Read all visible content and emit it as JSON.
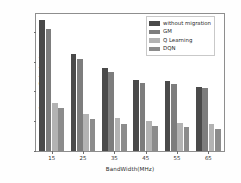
{
  "chart_data": {
    "type": "bar",
    "title": "",
    "xlabel": "BandWidth(MHz)",
    "ylabel": "Average Delay(ms)",
    "categories": [
      "15",
      "25",
      "35",
      "45",
      "55",
      "65"
    ],
    "xtick_labels": [
      "15",
      "25",
      "35",
      "45",
      "55",
      "65"
    ],
    "ytick_labels": [
      "0",
      "20",
      "40",
      "60",
      "80"
    ],
    "ytick_values": [
      0,
      20,
      40,
      60,
      80
    ],
    "ylim": [
      0,
      92
    ],
    "grid": false,
    "legend_position": "upper right",
    "series": [
      {
        "name": "without migration",
        "color": "#4a4a4a",
        "values": [
          88,
          65,
          55.5,
          48,
          47,
          43
        ]
      },
      {
        "name": "GM",
        "color": "#7d7d7d",
        "values": [
          82,
          62,
          53,
          46,
          45,
          42
        ]
      },
      {
        "name": "Q Learning",
        "color": "#b3b3b3",
        "values": [
          32,
          25,
          22,
          20,
          19,
          18
        ]
      },
      {
        "name": "DQN",
        "color": "#8c8c8c",
        "values": [
          29,
          21.5,
          18,
          16.5,
          16,
          15
        ]
      }
    ]
  },
  "figure": {
    "background_color": "#ffffff",
    "axis_color": "#8e8e8e"
  }
}
